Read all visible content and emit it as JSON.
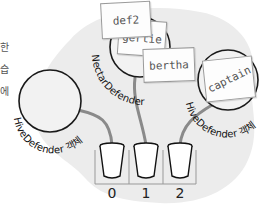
{
  "side_text": [
    "한",
    "습",
    "에"
  ],
  "objects": [
    {
      "type_label": "HiveDefender 객체",
      "name": "left-object"
    },
    {
      "type_label": "NectarDefender",
      "name": "middle-object"
    },
    {
      "type_label": "HiveDefender 객체",
      "name": "right-object"
    }
  ],
  "references": [
    "def2",
    "gertie",
    "bertha",
    "captain"
  ],
  "array": {
    "indices": [
      "0",
      "1",
      "2"
    ]
  },
  "colors": {
    "heap": "#ececec",
    "outline": "#1a1a1a",
    "string": "#8a8a8a"
  }
}
